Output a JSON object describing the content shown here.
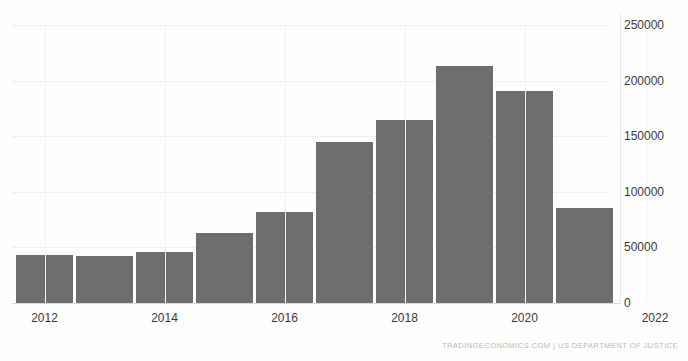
{
  "title_strip": "",
  "footer": {
    "attribution": "TRADINGECONOMICS.COM  |  US DEPARTMENT OF JUSTICE"
  },
  "axes": {
    "y_ticks": [
      "0",
      "50000",
      "100000",
      "150000",
      "200000",
      "250000"
    ],
    "x_ticks": [
      "2012",
      "2014",
      "2016",
      "2018",
      "2020",
      "2022"
    ]
  },
  "colors": {
    "bar": "#6e6e6e",
    "gridline": "#f0f0f0",
    "baseline": "#d8d8d8",
    "tick_text": "#3a3a3a",
    "footer_text": "#b9b9b9",
    "background": "#fefefe"
  },
  "chart_data": {
    "type": "bar",
    "title": "",
    "subtitle": "",
    "xlabel": "",
    "ylabel": "",
    "categories": [
      "2012",
      "2013",
      "2014",
      "2015",
      "2016",
      "2017",
      "2018",
      "2019",
      "2020",
      "2021"
    ],
    "values": [
      43000,
      42000,
      46000,
      63000,
      82000,
      145000,
      165000,
      213000,
      191000,
      85000
    ],
    "ylim": [
      0,
      250000
    ],
    "ytick_values": [
      0,
      50000,
      100000,
      150000,
      200000,
      250000
    ],
    "xtick_labels": [
      "2012",
      "2014",
      "2016",
      "2018",
      "2020",
      "2022"
    ],
    "grid": true,
    "legend": "none",
    "source": "US DEPARTMENT OF JUSTICE"
  }
}
